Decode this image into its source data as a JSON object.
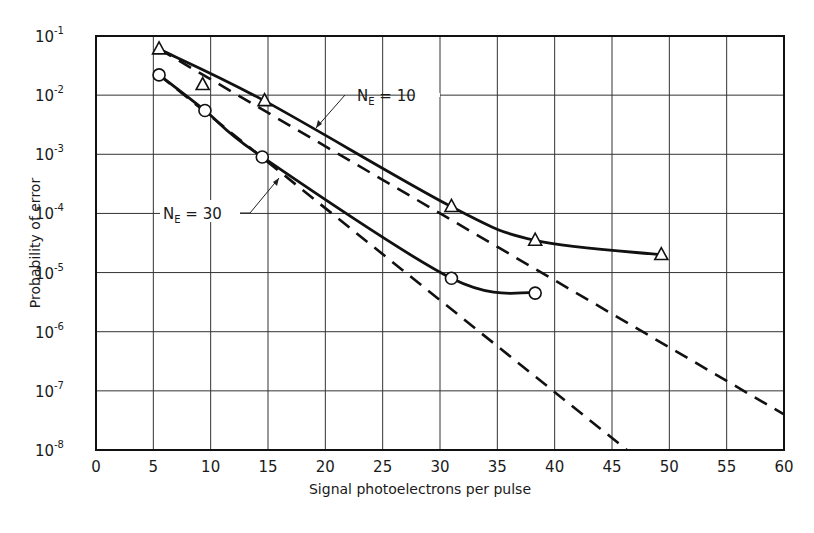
{
  "chart_data": {
    "type": "line",
    "title": "",
    "xlabel": "Signal photoelectrons per pulse",
    "ylabel": "Probability of error",
    "xlim": [
      0,
      60
    ],
    "ylim": [
      1e-08,
      0.1
    ],
    "yscale": "log",
    "grid": true,
    "x_ticks": [
      0,
      5,
      10,
      15,
      20,
      25,
      30,
      35,
      40,
      45,
      50,
      55,
      60
    ],
    "x_tick_labels": [
      "0",
      "5",
      "10",
      "15",
      "20",
      "25",
      "30",
      "35",
      "40",
      "45",
      "50",
      "55",
      "60"
    ],
    "y_ticks": [
      -1,
      -2,
      -3,
      -4,
      -5,
      -6,
      -7,
      -8
    ],
    "y_tick_base": "10",
    "series": [
      {
        "name": "N_E = 10 (measured)",
        "marker": "triangle",
        "style": "solid",
        "x": [
          5.5,
          9.3,
          14.7,
          31.0,
          38.3,
          49.3
        ],
        "y": [
          0.06,
          0.015,
          0.008,
          0.00013,
          3.5e-05,
          2e-05
        ]
      },
      {
        "name": "N_E = 30 (measured)",
        "marker": "circle",
        "style": "solid",
        "x": [
          5.5,
          9.5,
          14.5,
          31.0,
          38.3
        ],
        "y": [
          0.022,
          0.0055,
          0.0009,
          8e-06,
          4.5e-06
        ]
      },
      {
        "name": "N_E = 10 (theory)",
        "marker": "none",
        "style": "dashed",
        "x": [
          5.5,
          60
        ],
        "y": [
          0.06,
          4e-08
        ]
      },
      {
        "name": "N_E = 30 (theory)",
        "marker": "none",
        "style": "dashed",
        "x": [
          5.5,
          46.3
        ],
        "y": [
          0.022,
          1e-08
        ]
      }
    ],
    "annotations": [
      {
        "text_main": "N",
        "text_sub": "E",
        "text_rest": " = 10",
        "target_series": "N_E = 10"
      },
      {
        "text_main": "N",
        "text_sub": "E",
        "text_rest": " = 30",
        "target_series": "N_E = 30"
      }
    ]
  }
}
